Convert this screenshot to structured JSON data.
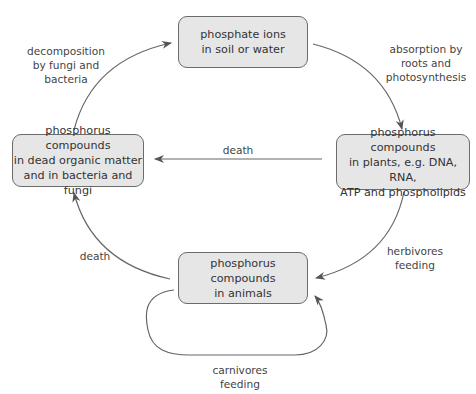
{
  "diagram": {
    "colors": {
      "box_fill": "#e6e6e6",
      "box_border": "#6b6b6b",
      "arrow": "#555555",
      "text": "#333333"
    },
    "nodes": [
      {
        "id": "phosphate",
        "text": "phosphate ions\nin soil or water"
      },
      {
        "id": "plants",
        "text": "phosphorus compounds\nin plants, e.g. DNA, RNA,\nATP and phospholipids"
      },
      {
        "id": "dead",
        "text": "phosphorus compounds\nin dead organic matter\nand in bacteria and fungi"
      },
      {
        "id": "animals",
        "text": "phosphorus compounds\nin animals"
      }
    ],
    "edges": [
      {
        "from": "phosphate",
        "to": "plants",
        "label": "absorption by\nroots and\nphotosynthesis"
      },
      {
        "from": "plants",
        "to": "dead",
        "label": "death"
      },
      {
        "from": "plants",
        "to": "animals",
        "label": "herbivores\nfeeding"
      },
      {
        "from": "animals",
        "to": "dead",
        "label": "death"
      },
      {
        "from": "dead",
        "to": "phosphate",
        "label": "decomposition\nby fungi and\nbacteria"
      },
      {
        "from": "animals",
        "to": "animals",
        "label": "carnivores\nfeeding"
      }
    ]
  }
}
